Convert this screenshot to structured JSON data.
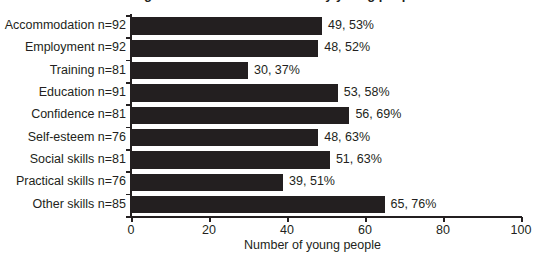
{
  "title_remnant": "Figure 4: Outcomes achieved by young people",
  "axis": {
    "x_label": "Number of young people",
    "x_ticks": [
      0,
      20,
      40,
      60,
      80,
      100
    ],
    "x_tick_labels": [
      "0",
      "20",
      "40",
      "60",
      "80",
      "100"
    ],
    "x_min": 0,
    "x_max": 100
  },
  "colors": {
    "bar": "#231f20",
    "axis": "#231f20",
    "text": "#231f20",
    "background": "#ffffff"
  },
  "chart_data": {
    "type": "bar",
    "orientation": "horizontal",
    "title": "",
    "xlabel": "Number of young people",
    "ylabel": "",
    "xlim": [
      0,
      100
    ],
    "grid": false,
    "legend": false,
    "categories": [
      "Accommodation n=92",
      "Employment n=92",
      "Training n=81",
      "Education n=91",
      "Confidence n=81",
      "Self-esteem n=76",
      "Social skills n=81",
      "Practical skills n=76",
      "Other skills n=85"
    ],
    "values": [
      49,
      48,
      30,
      53,
      56,
      48,
      51,
      39,
      65
    ],
    "percentages": [
      53,
      52,
      37,
      58,
      69,
      63,
      63,
      51,
      76
    ],
    "data_labels": [
      "49, 53%",
      "48, 52%",
      "30, 37%",
      "53, 58%",
      "56, 69%",
      "48, 63%",
      "51, 63%",
      "39, 51%",
      "65, 76%"
    ],
    "base_n": [
      92,
      92,
      81,
      91,
      81,
      76,
      81,
      76,
      85
    ]
  }
}
